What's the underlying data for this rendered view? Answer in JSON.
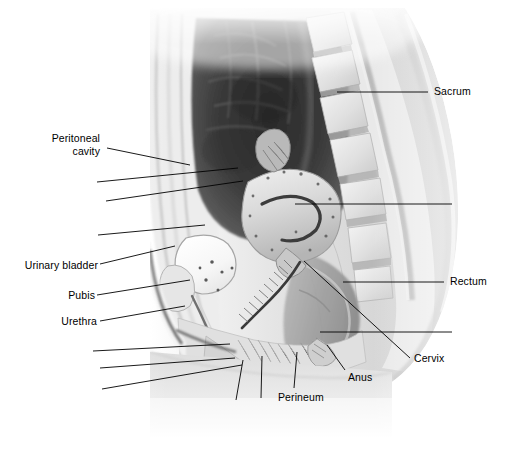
{
  "figure": {
    "kind": "sagittal-section-illustration",
    "width": 512,
    "height": 473,
    "background_color": "#ffffff",
    "ink_color": "#000000",
    "label_font_size_px": 10.5
  },
  "labels": [
    {
      "id": "peritoneal-cavity",
      "text_line1": "Peritoneal",
      "text_line2": "cavity",
      "text": "Peritoneal cavity",
      "x": 46,
      "y": 138,
      "align": "right-align",
      "leader": {
        "x1": 107,
        "y1": 148,
        "x2": 190,
        "y2": 165
      }
    },
    {
      "id": "urinary-bladder",
      "text": "Urinary bladder",
      "x": 18,
      "y": 259,
      "align": "right-align",
      "leader": {
        "x1": 100,
        "y1": 264,
        "x2": 175,
        "y2": 246
      }
    },
    {
      "id": "pubis",
      "text": "Pubis",
      "x": 60,
      "y": 289,
      "align": "right-align",
      "leader": {
        "x1": 97,
        "y1": 295,
        "x2": 190,
        "y2": 280
      }
    },
    {
      "id": "urethra",
      "text": "Urethra",
      "x": 52,
      "y": 315,
      "align": "right-align",
      "leader": {
        "x1": 100,
        "y1": 321,
        "x2": 185,
        "y2": 306
      }
    },
    {
      "id": "sacrum",
      "text": "Sacrum",
      "x": 434,
      "y": 84,
      "align": "left",
      "leader": {
        "x1": 337,
        "y1": 92,
        "x2": 428,
        "y2": 92
      }
    },
    {
      "id": "rectum",
      "text": "Rectum",
      "x": 450,
      "y": 275,
      "align": "left",
      "leader": {
        "x1": 343,
        "y1": 282,
        "x2": 444,
        "y2": 282
      }
    },
    {
      "id": "cervix",
      "text": "Cervix",
      "x": 414,
      "y": 354,
      "align": "left",
      "leader": {
        "x1": 304,
        "y1": 261,
        "x2": 410,
        "y2": 358
      }
    },
    {
      "id": "anus",
      "text": "Anus",
      "x": 348,
      "y": 372,
      "align": "left",
      "leader": {
        "x1": 345,
        "y1": 370,
        "x2": 327,
        "y2": 345
      }
    },
    {
      "id": "perineum",
      "text": "Perineum",
      "x": 278,
      "y": 392,
      "align": "left",
      "leader": {
        "x1": 294,
        "y1": 388,
        "x2": 297,
        "y2": 352
      }
    }
  ],
  "unlabeled_leaders": [
    {
      "id": "leader-uterus-upper",
      "x1": 97,
      "y1": 182,
      "x2": 238,
      "y2": 168
    },
    {
      "id": "leader-uterus-lower",
      "x1": 106,
      "y1": 201,
      "x2": 243,
      "y2": 181
    },
    {
      "id": "leader-uterine-cavity-right",
      "x1": 295,
      "y1": 204,
      "x2": 452,
      "y2": 204
    },
    {
      "id": "leader-vagina",
      "x1": 98,
      "y1": 235,
      "x2": 205,
      "y2": 225
    },
    {
      "id": "leader-posterior-fornix",
      "x1": 320,
      "y1": 332,
      "x2": 452,
      "y2": 332
    },
    {
      "id": "leader-lower-1",
      "x1": 93,
      "y1": 351,
      "x2": 230,
      "y2": 344
    },
    {
      "id": "leader-lower-2",
      "x1": 100,
      "y1": 368,
      "x2": 235,
      "y2": 358
    },
    {
      "id": "leader-lower-3",
      "x1": 102,
      "y1": 389,
      "x2": 242,
      "y2": 365
    },
    {
      "id": "leader-labium",
      "x1": 236,
      "y1": 400,
      "x2": 243,
      "y2": 360
    },
    {
      "id": "leader-clitoris",
      "x1": 261,
      "y1": 398,
      "x2": 262,
      "y2": 356
    }
  ]
}
